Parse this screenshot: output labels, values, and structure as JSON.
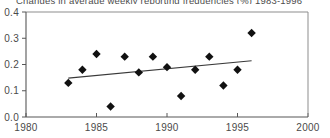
{
  "chart_data": {
    "type": "scatter",
    "title": "Changes in average weekly reporting frequencies (%) 1983-1996",
    "xlabel": "",
    "ylabel": "",
    "xlim": [
      1980,
      2000
    ],
    "ylim": [
      0.0,
      0.4
    ],
    "grid": false,
    "legend": null,
    "x_ticks": [
      1980,
      1985,
      1990,
      1995,
      2000
    ],
    "x_tick_labels": [
      "1980",
      "1985",
      "1990",
      "1995",
      "2000"
    ],
    "y_ticks": [
      0.0,
      0.1,
      0.2,
      0.3,
      0.4
    ],
    "y_tick_labels": [
      "0.0",
      "0.1",
      "0.2",
      "0.3",
      "0.4"
    ],
    "x": [
      1983,
      1984,
      1985,
      1986,
      1987,
      1988,
      1989,
      1990,
      1991,
      1992,
      1993,
      1994,
      1995,
      1996
    ],
    "values": [
      0.13,
      0.18,
      0.24,
      0.04,
      0.23,
      0.17,
      0.23,
      0.19,
      0.08,
      0.18,
      0.23,
      0.12,
      0.18,
      0.32
    ],
    "series": [
      {
        "name": "Average weekly reporting frequency change",
        "marker": "diamond",
        "color": "#111111",
        "values": [
          0.13,
          0.18,
          0.24,
          0.04,
          0.23,
          0.17,
          0.23,
          0.19,
          0.08,
          0.18,
          0.23,
          0.12,
          0.18,
          0.32
        ]
      }
    ],
    "trendline": {
      "type": "linear",
      "x_start": 1983,
      "y_start": 0.148,
      "x_end": 1996,
      "y_end": 0.214,
      "color": "#3a3a3a"
    },
    "marker_size": 4.2
  }
}
